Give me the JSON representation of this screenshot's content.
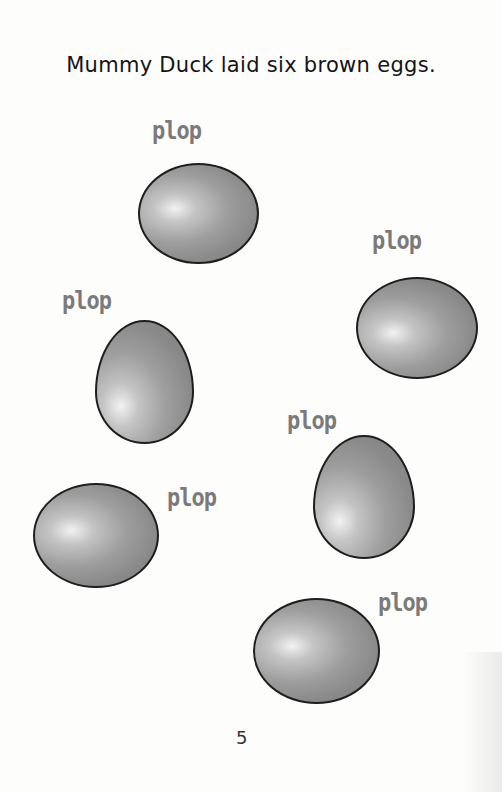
{
  "page": {
    "sentence": "Mummy Duck laid six brown eggs.",
    "page_number": "5",
    "eggs": [
      {
        "label": "plop",
        "plop_x": 152,
        "plop_y": 118,
        "egg_x": 138,
        "egg_y": 163,
        "egg_w": 121,
        "egg_h": 101,
        "hl_x": "30%",
        "hl_y": "45%"
      },
      {
        "label": "plop",
        "plop_x": 372,
        "plop_y": 228,
        "egg_x": 356,
        "egg_y": 277,
        "egg_w": 122,
        "egg_h": 102,
        "hl_x": "30%",
        "hl_y": "55%"
      },
      {
        "label": "plop",
        "plop_x": 62,
        "plop_y": 288,
        "egg_x": 95,
        "egg_y": 320,
        "egg_w": 99,
        "egg_h": 124,
        "hl_x": "25%",
        "hl_y": "70%"
      },
      {
        "label": "plop",
        "plop_x": 287,
        "plop_y": 408,
        "egg_x": 313,
        "egg_y": 435,
        "egg_w": 102,
        "egg_h": 124,
        "hl_x": "25%",
        "hl_y": "70%"
      },
      {
        "label": "plop",
        "plop_x": 167,
        "plop_y": 485,
        "egg_x": 33,
        "egg_y": 483,
        "egg_w": 126,
        "egg_h": 105,
        "hl_x": "30%",
        "hl_y": "45%"
      },
      {
        "label": "plop",
        "plop_x": 378,
        "plop_y": 590,
        "egg_x": 253,
        "egg_y": 598,
        "egg_w": 127,
        "egg_h": 106,
        "hl_x": "30%",
        "hl_y": "45%"
      }
    ]
  }
}
